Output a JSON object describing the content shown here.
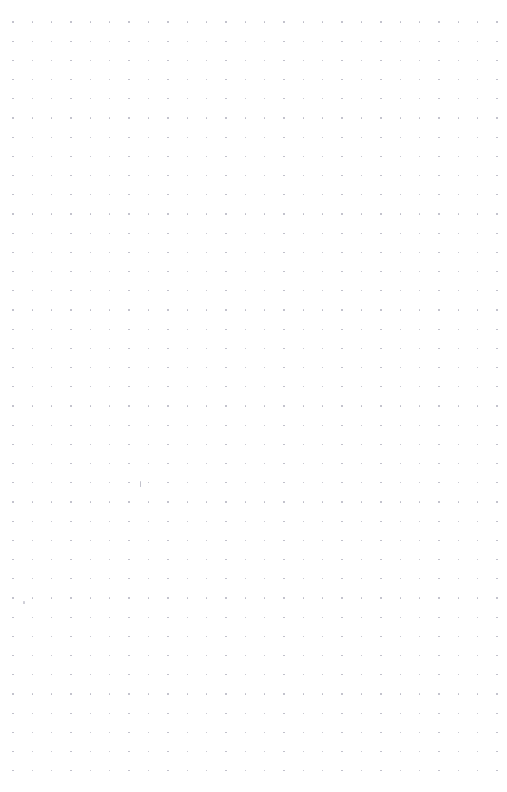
{
  "page": {
    "width": 507,
    "height": 792,
    "background_color": "#ffffff",
    "content_text": ""
  },
  "grid": {
    "name": "dot-grid",
    "columns": 26,
    "rows": 40,
    "origin_x": 13,
    "origin_y": 22,
    "spacing_x": 19.36,
    "spacing_y": 19.2,
    "dot_diameter": 1.4,
    "dot_color": "#b9b9c4",
    "margin_left": 13,
    "margin_top": 22,
    "margin_right": 10,
    "margin_bottom": 21
  },
  "artifacts": [
    {
      "name": "pen-mark-center",
      "x": 140,
      "y": 481,
      "width": 1,
      "height": 6,
      "color": "#c2c2cc"
    },
    {
      "name": "pen-mark-left",
      "x": 23,
      "y": 601,
      "width": 2,
      "height": 3,
      "color": "#d0d0d8"
    }
  ]
}
